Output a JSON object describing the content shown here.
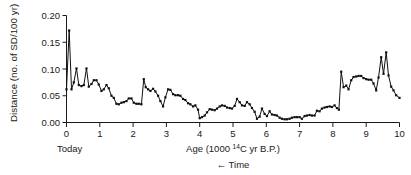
{
  "chart_data": {
    "type": "line",
    "title": "",
    "subtitle": "",
    "xlabel": "Age (1000 14C yr B.P.)",
    "xlabel_parts": {
      "pre": "Age (1000 ",
      "sup": "14",
      "post": "C yr B.P.)"
    },
    "ylabel": "Distance (no. of SD/100 yr)",
    "xlim": [
      0,
      10
    ],
    "ylim": [
      0.0,
      0.2
    ],
    "xticks": [
      0,
      1,
      2,
      3,
      4,
      5,
      6,
      7,
      8,
      9,
      10
    ],
    "xtick_labels": [
      "0",
      "1",
      "2",
      "3",
      "4",
      "5",
      "6",
      "7",
      "8",
      "9",
      "10"
    ],
    "yticks": [
      0.0,
      0.05,
      0.1,
      0.15,
      0.2
    ],
    "ytick_labels": [
      "0.00",
      "0.05",
      "0.10",
      "0.15",
      "0.20"
    ],
    "grid": false,
    "legend": null,
    "annotations": [
      {
        "name": "today-label",
        "text": "Today",
        "x": 0,
        "position": "below-axis-left"
      },
      {
        "name": "time-direction-label",
        "text": "← Time",
        "position": "below-xlabel"
      }
    ],
    "marker": "square",
    "line_color": "#101010",
    "marker_color": "#101010",
    "x": [
      0.0,
      0.08,
      0.15,
      0.22,
      0.3,
      0.37,
      0.45,
      0.52,
      0.6,
      0.67,
      0.75,
      0.82,
      0.9,
      0.97,
      1.05,
      1.12,
      1.2,
      1.27,
      1.35,
      1.42,
      1.5,
      1.57,
      1.65,
      1.72,
      1.8,
      1.87,
      1.95,
      2.02,
      2.1,
      2.17,
      2.25,
      2.32,
      2.38,
      2.45,
      2.52,
      2.6,
      2.67,
      2.75,
      2.82,
      2.9,
      2.97,
      3.05,
      3.12,
      3.2,
      3.27,
      3.35,
      3.42,
      3.5,
      3.57,
      3.65,
      3.72,
      3.8,
      3.87,
      3.95,
      4.0,
      4.07,
      4.15,
      4.22,
      4.3,
      4.37,
      4.45,
      4.52,
      4.6,
      4.67,
      4.75,
      4.82,
      4.9,
      4.97,
      5.05,
      5.12,
      5.2,
      5.27,
      5.35,
      5.42,
      5.5,
      5.57,
      5.65,
      5.72,
      5.8,
      5.87,
      5.95,
      6.02,
      6.1,
      6.17,
      6.25,
      6.32,
      6.4,
      6.47,
      6.55,
      6.62,
      6.7,
      6.77,
      6.85,
      6.92,
      7.0,
      7.07,
      7.15,
      7.22,
      7.3,
      7.37,
      7.45,
      7.52,
      7.6,
      7.67,
      7.75,
      7.82,
      7.9,
      7.97,
      8.05,
      8.12,
      8.18,
      8.25,
      8.32,
      8.4,
      8.47,
      8.55,
      8.62,
      8.7,
      8.77,
      8.85,
      8.92,
      9.0,
      9.07,
      9.15,
      9.22,
      9.3,
      9.37,
      9.45,
      9.52,
      9.6,
      9.67,
      9.75,
      9.82,
      9.9,
      10.0
    ],
    "y": [
      0.062,
      0.172,
      0.062,
      0.075,
      0.101,
      0.07,
      0.068,
      0.07,
      0.101,
      0.067,
      0.072,
      0.079,
      0.079,
      0.071,
      0.059,
      0.062,
      0.07,
      0.064,
      0.05,
      0.046,
      0.035,
      0.034,
      0.037,
      0.038,
      0.04,
      0.045,
      0.045,
      0.037,
      0.035,
      0.035,
      0.034,
      0.081,
      0.066,
      0.062,
      0.059,
      0.063,
      0.058,
      0.05,
      0.04,
      0.03,
      0.047,
      0.062,
      0.061,
      0.053,
      0.051,
      0.051,
      0.05,
      0.044,
      0.042,
      0.036,
      0.034,
      0.03,
      0.032,
      0.024,
      0.008,
      0.01,
      0.013,
      0.019,
      0.025,
      0.024,
      0.023,
      0.026,
      0.03,
      0.032,
      0.031,
      0.028,
      0.027,
      0.026,
      0.031,
      0.044,
      0.038,
      0.032,
      0.031,
      0.038,
      0.034,
      0.027,
      0.02,
      0.007,
      0.011,
      0.026,
      0.016,
      0.012,
      0.021,
      0.015,
      0.014,
      0.013,
      0.009,
      0.007,
      0.006,
      0.006,
      0.007,
      0.009,
      0.01,
      0.01,
      0.01,
      0.007,
      0.012,
      0.013,
      0.014,
      0.013,
      0.013,
      0.022,
      0.021,
      0.026,
      0.028,
      0.029,
      0.03,
      0.029,
      0.032,
      0.027,
      0.024,
      0.095,
      0.066,
      0.069,
      0.062,
      0.079,
      0.085,
      0.086,
      0.087,
      0.087,
      0.083,
      0.081,
      0.08,
      0.08,
      0.073,
      0.06,
      0.084,
      0.122,
      0.091,
      0.131,
      0.088,
      0.067,
      0.06,
      0.051,
      0.046
    ]
  }
}
